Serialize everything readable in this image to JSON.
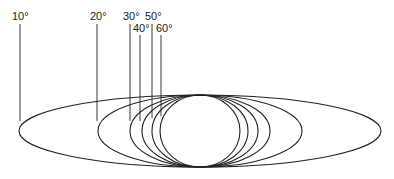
{
  "diagram": {
    "title": "",
    "stroke_color": "#222222",
    "center": {
      "x": 200,
      "y": 131
    },
    "ry": 36,
    "ellipses": [
      {
        "label": "10°",
        "rx": 181,
        "label_x": 12,
        "label_y": 20,
        "line_x": 20,
        "line_top": 24,
        "line_bottom": 121
      },
      {
        "label": "20°",
        "rx": 102,
        "label_x": 90,
        "label_y": 20,
        "line_x": 97,
        "line_top": 24,
        "line_bottom": 121
      },
      {
        "label": "30°",
        "rx": 70,
        "label_x": 123,
        "label_y": 20,
        "line_x": 130,
        "line_top": 24,
        "line_bottom": 121
      },
      {
        "label": "40°",
        "rx": 58,
        "label_x": 133,
        "label_y": 32,
        "line_x": 140,
        "line_top": 35,
        "line_bottom": 121
      },
      {
        "label": "50°",
        "rx": 48,
        "label_x": 145,
        "label_y": 20,
        "line_x": 152,
        "line_top": 24,
        "line_bottom": 118
      },
      {
        "label": "60°",
        "rx": 40,
        "label_x": 156,
        "label_y": 32,
        "line_x": 161,
        "line_top": 35,
        "line_bottom": 116
      }
    ]
  }
}
